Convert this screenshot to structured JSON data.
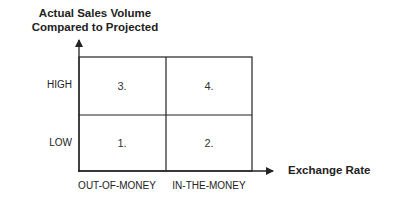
{
  "diagram": {
    "y_axis_title_line1": "Actual Sales Volume",
    "y_axis_title_line2": "Compared to Projected",
    "x_axis_title": "Exchange Rate",
    "row_labels": {
      "high": "HIGH",
      "low": "LOW"
    },
    "column_labels": {
      "left": "OUT-OF-MONEY",
      "right": "IN-THE-MONEY"
    },
    "quadrants": {
      "top_left": "3.",
      "top_right": "4.",
      "bottom_left": "1.",
      "bottom_right": "2."
    },
    "line_color": "#222222"
  }
}
